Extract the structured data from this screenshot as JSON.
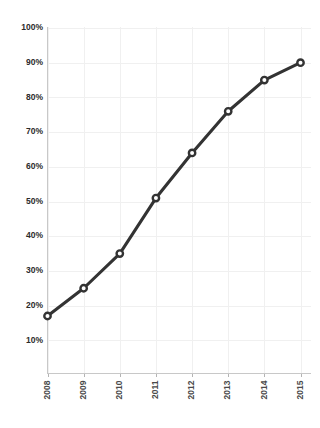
{
  "chart_data": {
    "type": "line",
    "title": "",
    "subtitle": "",
    "xlabel": "",
    "ylabel": "",
    "categories": [
      "2008",
      "2009",
      "2010",
      "2011",
      "2012",
      "2013",
      "2014",
      "2015"
    ],
    "values": [
      17,
      25,
      35,
      51,
      64,
      76,
      85,
      90
    ],
    "series": [
      {
        "name": "",
        "values": [
          17,
          25,
          35,
          51,
          64,
          76,
          85,
          90
        ]
      }
    ],
    "ylim": [
      0,
      100
    ],
    "y_ticks": [
      10,
      20,
      30,
      40,
      50,
      60,
      70,
      80,
      90,
      100
    ],
    "y_tick_labels": [
      "10%",
      "20%",
      "30%",
      "40%",
      "50%",
      "60%",
      "70%",
      "80%",
      "90%",
      "100%"
    ],
    "x_tick_labels": [
      "2008",
      "2009",
      "2010",
      "2011",
      "2012",
      "2013",
      "2014",
      "2015"
    ],
    "x_tick_label_rotation": -90,
    "grid": true,
    "legend": false,
    "legend_position": "none",
    "marker": "circle-open",
    "colors": {
      "line": "#333333",
      "marker_fill": "#ffffff",
      "marker_stroke": "#333333",
      "grid": "#f0f0f0",
      "axis": "#c8c8c8",
      "tick_label": "#2b2b2b",
      "background": "#ffffff"
    },
    "annotations": []
  }
}
